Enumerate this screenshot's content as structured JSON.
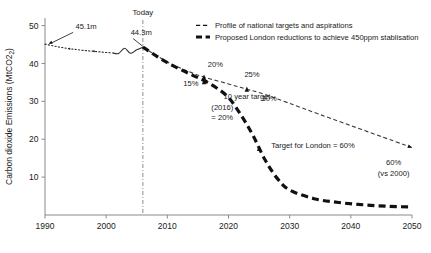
{
  "chart_data": {
    "type": "line",
    "title": "",
    "xlabel": "",
    "ylabel": "Carbon dioxide Emissions (MtCO2)",
    "xlim": [
      1990,
      2050
    ],
    "ylim": [
      0,
      52
    ],
    "xticks": [
      1990,
      2000,
      2010,
      2020,
      2030,
      2040,
      2050
    ],
    "xticklabels": [
      "1990",
      "2000",
      "2010",
      "2020",
      "2030",
      "2040",
      "2050"
    ],
    "yticks": [
      10,
      20,
      30,
      40,
      50
    ],
    "yticklabels": [
      "10",
      "20",
      "30",
      "40",
      "50"
    ],
    "grid": false,
    "legend_position": "top-right",
    "series": [
      {
        "name": "historical-dotted",
        "style": "dotted",
        "x": [
          1990,
          1992,
          1994,
          1996,
          1998,
          2000,
          2001
        ],
        "values": [
          45.1,
          44.4,
          43.9,
          43.5,
          43.2,
          42.9,
          42.8
        ]
      },
      {
        "name": "historical-solid",
        "style": "solid",
        "x": [
          2001,
          2002,
          2003,
          2004,
          2005,
          2006
        ],
        "values": [
          42.8,
          42.6,
          44.0,
          42.7,
          43.6,
          44.3
        ]
      },
      {
        "name": "Profile of national targets and aspirations",
        "style": "thin-dashed",
        "x": [
          2006,
          2010,
          2013,
          2016,
          2020,
          2023,
          2026,
          2035,
          2050
        ],
        "values": [
          44.3,
          40.4,
          38.2,
          36.4,
          34.6,
          33.2,
          31.8,
          26.5,
          17.8
        ]
      },
      {
        "name": "Proposed London reductions to achieve 450ppm stablisation",
        "style": "thick-dashed",
        "x": [
          2006,
          2010,
          2014,
          2016,
          2018,
          2020,
          2022,
          2024,
          2026,
          2028,
          2030,
          2034,
          2038,
          2042,
          2046,
          2050
        ],
        "values": [
          44.3,
          40.2,
          37.0,
          35.5,
          33.6,
          31.0,
          26.5,
          21.0,
          14.5,
          9.6,
          6.6,
          4.3,
          3.3,
          2.7,
          2.3,
          2.1
        ]
      }
    ],
    "markers": [
      {
        "name": "marker-2016-national",
        "x": 2016,
        "y": 36.4
      },
      {
        "name": "marker-2016-london",
        "x": 2016,
        "y": 35.2
      },
      {
        "name": "marker-2023-national",
        "x": 2023,
        "y": 33.2
      },
      {
        "name": "marker-2025-london",
        "x": 2025,
        "y": 17.6
      }
    ],
    "annotations": [
      {
        "name": "annotation-1990-value",
        "text": "45.1m",
        "x": 1995.0,
        "y": 49.2
      },
      {
        "name": "annotation-2006-value",
        "text": "44.3m",
        "x": 2004.0,
        "y": 47.5
      },
      {
        "name": "annotation-15-percent",
        "text": "15%",
        "x": 2012.6,
        "y": 34.0
      },
      {
        "name": "annotation-20-percent",
        "text": "20%",
        "x": 2016.6,
        "y": 39.0
      },
      {
        "name": "annotation-25-percent",
        "text": "25%",
        "x": 2022.6,
        "y": 36.4
      },
      {
        "name": "annotation-30-percent",
        "text": "30%",
        "x": 2025.4,
        "y": 30.2
      },
      {
        "name": "annotation-ten-year-target-line1",
        "text": "10 year target",
        "x": 2019.2,
        "y": 30.6
      },
      {
        "name": "annotation-ten-year-target-line2",
        "text": "(2016)",
        "x": 2017.2,
        "y": 27.8
      },
      {
        "name": "annotation-ten-year-target-line3",
        "text": "= 20%",
        "x": 2017.2,
        "y": 25.0
      },
      {
        "name": "annotation-target-for-london",
        "text": "Target for London = 60%",
        "x": 2027.0,
        "y": 17.8
      },
      {
        "name": "annotation-end-60-percent",
        "text": "60%",
        "x": 2047.0,
        "y": 13.2
      },
      {
        "name": "annotation-end-vs-2000",
        "text": "(vs 2000)",
        "x": 2047.0,
        "y": 10.4
      }
    ],
    "today_marker": {
      "label": "Today",
      "x": 2006
    }
  },
  "legend": {
    "items": [
      {
        "label": "Profile of national targets and aspirations",
        "style": "thin-dashed"
      },
      {
        "label": "Proposed London reductions to achieve 450ppm stablisation",
        "style": "thick-dashed"
      }
    ]
  },
  "colors": {
    "axis": "#8a8a8a",
    "text": "#1a1a1a",
    "national": "#3a3a3a",
    "london": "#111111",
    "today": "#8f8f8f"
  }
}
